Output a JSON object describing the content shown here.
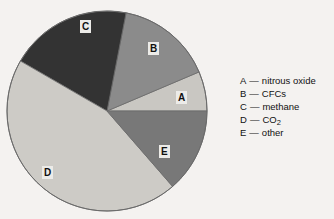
{
  "chart_data": {
    "type": "pie",
    "title": "",
    "subtitle": "",
    "xlabel": "",
    "ylabel": "",
    "legend_position": "right",
    "grid": false,
    "categories": [
      "A",
      "B",
      "C",
      "D",
      "E"
    ],
    "labels": [
      "A",
      "B",
      "C",
      "D",
      "E"
    ],
    "names": [
      "nitrous oxide",
      "CFCs",
      "methane",
      "CO2",
      "other"
    ],
    "values": [
      6.4,
      15.6,
      19.7,
      44.7,
      13.6
    ],
    "start_angle_deg": 0,
    "direction": "counterclockwise",
    "slices": [
      {
        "key": "A",
        "name": "nitrous oxide",
        "value": 6.4,
        "start_deg": 0,
        "end_deg": 23,
        "color": "#c9c7c2"
      },
      {
        "key": "B",
        "name": "CFCs",
        "value": 15.6,
        "start_deg": 23,
        "end_deg": 79,
        "color": "#8b8b8b"
      },
      {
        "key": "C",
        "name": "methane",
        "value": 19.7,
        "start_deg": 79,
        "end_deg": 150,
        "color": "#333333"
      },
      {
        "key": "D",
        "name": "CO2",
        "value": 44.7,
        "start_deg": 150,
        "end_deg": 311,
        "color": "#cdcbc6"
      },
      {
        "key": "E",
        "name": "other",
        "value": 13.6,
        "start_deg": 311,
        "end_deg": 360,
        "color": "#787878"
      }
    ],
    "colors": {
      "A": "#c9c7c2",
      "B": "#8b8b8b",
      "C": "#333333",
      "D": "#cdcbc6",
      "E": "#787878",
      "background": "#f4f2f0",
      "outline": "#6a6a6a",
      "label_box": "#ecebe8",
      "text": "#111111"
    }
  },
  "pie": {
    "center_x": 107,
    "center_y": 111,
    "radius": 100,
    "slice_labels": [
      {
        "key": "A",
        "x": 176,
        "y": 91
      },
      {
        "key": "B",
        "x": 148,
        "y": 42
      },
      {
        "key": "C",
        "x": 80,
        "y": 20
      },
      {
        "key": "D",
        "x": 42,
        "y": 166
      },
      {
        "key": "E",
        "x": 159,
        "y": 145
      }
    ]
  },
  "legend": {
    "dash": "—",
    "rows": [
      {
        "key": "A",
        "name": "nitrous oxide",
        "sub": ""
      },
      {
        "key": "B",
        "name": "CFCs",
        "sub": ""
      },
      {
        "key": "C",
        "name": "methane",
        "sub": ""
      },
      {
        "key": "D",
        "name": "CO",
        "sub": "2"
      },
      {
        "key": "E",
        "name": "other",
        "sub": ""
      }
    ]
  }
}
